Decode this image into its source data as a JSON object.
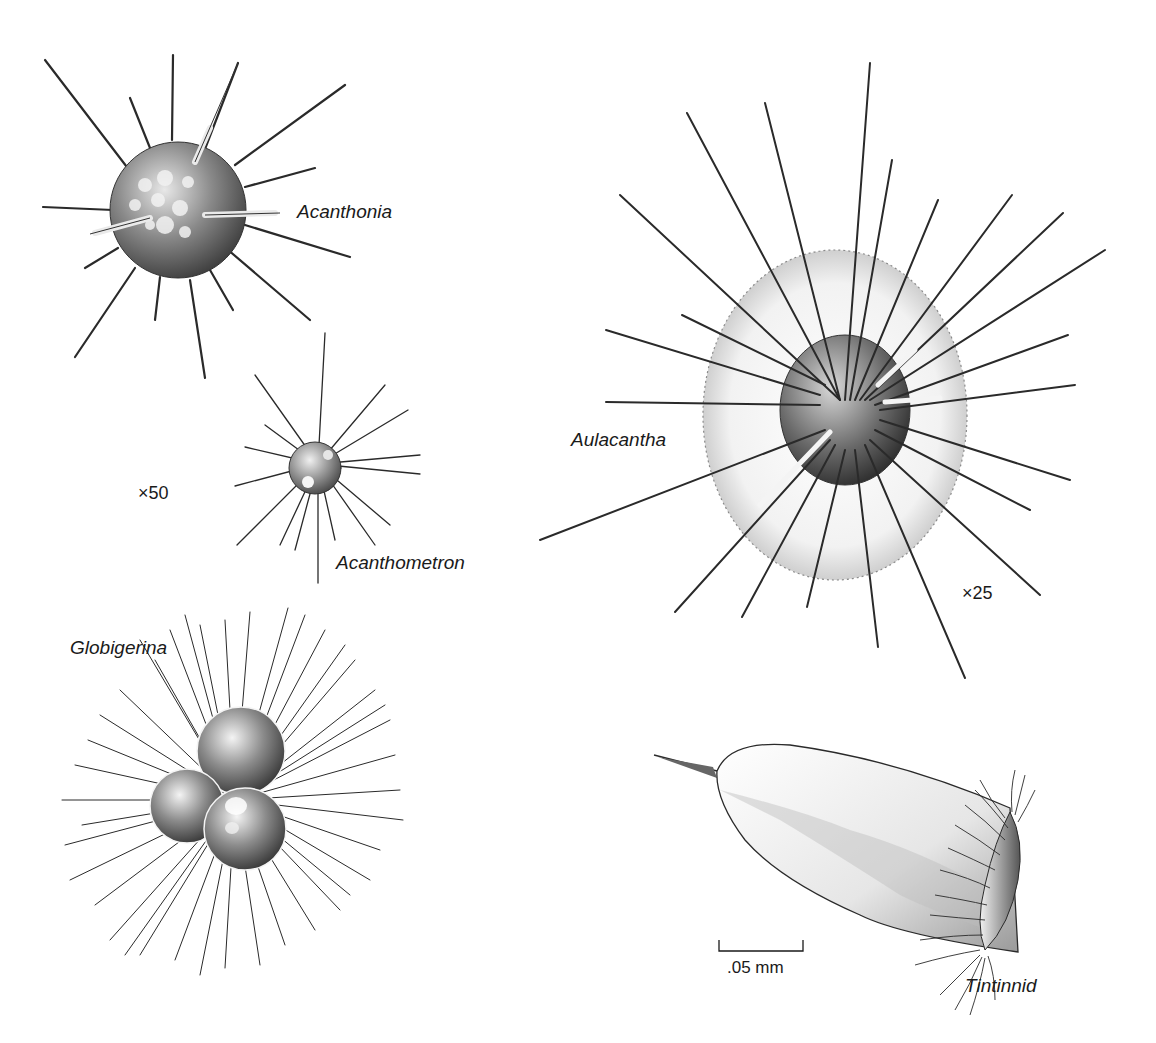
{
  "figure": {
    "organisms": [
      {
        "id": "acanthonia",
        "label": "Acanthonia"
      },
      {
        "id": "acanthometron",
        "label": "Acanthometron"
      },
      {
        "id": "aulacantha",
        "label": "Aulacantha"
      },
      {
        "id": "globigerina",
        "label": "Globigerina"
      },
      {
        "id": "tintinnid",
        "label": "Tintinnid"
      }
    ],
    "magnifications": {
      "radiolarian_left": "×50",
      "aulacantha": "×25"
    },
    "scale_bar": {
      "label": ".05 mm"
    },
    "colors": {
      "ink": "#1a1a1a",
      "background": "#ffffff"
    }
  }
}
